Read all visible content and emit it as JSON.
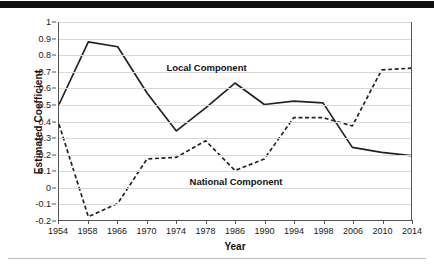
{
  "chart_data": {
    "type": "line",
    "title": "",
    "xlabel": "Year",
    "ylabel": "Estimated Coefficient",
    "categories": [
      "1954",
      "1958",
      "1966",
      "1970",
      "1974",
      "1978",
      "1986",
      "1990",
      "1994",
      "1998",
      "2006",
      "2010",
      "2014"
    ],
    "ylim": [
      -0.2,
      1.0
    ],
    "yticks": [
      1,
      0.9,
      0.8,
      0.7,
      0.6,
      0.5,
      0.4,
      0.3,
      0.2,
      0.1,
      0,
      -0.1,
      -0.2
    ],
    "ytick_labels": [
      "1",
      "0.9",
      "0.8",
      "0.7",
      "0.6",
      "0.5",
      "0.4",
      "0.3",
      "0.2",
      "0.1",
      "0",
      "-0.1",
      "-0.2"
    ],
    "grid": true,
    "legend_position": "inline-annotations",
    "series": [
      {
        "name": "Local Component",
        "style": "solid",
        "color": "#222222",
        "values": [
          0.5,
          0.88,
          0.85,
          0.57,
          0.34,
          0.48,
          0.63,
          0.5,
          0.52,
          0.51,
          0.24,
          0.21,
          0.19
        ],
        "annotation": {
          "label": "Local Component",
          "at_category": "1978",
          "at_value": 0.72
        }
      },
      {
        "name": "National Component",
        "style": "dashed",
        "color": "#222222",
        "values": [
          0.38,
          -0.18,
          -0.1,
          0.17,
          0.18,
          0.28,
          0.1,
          0.17,
          0.42,
          0.42,
          0.37,
          0.71,
          0.72
        ],
        "annotation": {
          "label": "National Component",
          "at_category": "1986",
          "at_value": 0.035
        }
      }
    ]
  },
  "axes": {
    "y_title": "Estimated Coefficient",
    "x_title": "Year"
  }
}
